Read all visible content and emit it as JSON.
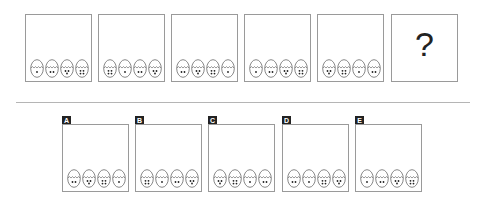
{
  "puzzle": {
    "sequence": [
      {
        "dots": [
          1,
          2,
          3,
          4
        ]
      },
      {
        "dots": [
          4,
          1,
          2,
          3
        ]
      },
      {
        "dots": [
          2,
          3,
          4,
          1
        ]
      },
      {
        "dots": [
          1,
          2,
          3,
          4
        ]
      },
      {
        "dots": [
          3,
          4,
          1,
          2
        ]
      }
    ],
    "question_mark": "?"
  },
  "options": [
    {
      "label": "A",
      "dots": [
        2,
        3,
        4,
        1
      ]
    },
    {
      "label": "B",
      "dots": [
        4,
        1,
        2,
        3
      ]
    },
    {
      "label": "C",
      "dots": [
        3,
        4,
        1,
        2
      ]
    },
    {
      "label": "D",
      "dots": [
        2,
        1,
        4,
        3
      ]
    },
    {
      "label": "E",
      "dots": [
        1,
        2,
        3,
        4
      ]
    }
  ],
  "colors": {
    "stroke": "#555555",
    "frame": "#9a9a9a",
    "label_bg": "#222222"
  }
}
